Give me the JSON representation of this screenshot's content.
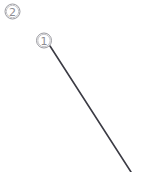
{
  "figure": {
    "width": 166,
    "height": 172,
    "background_color": "#ffffff",
    "callouts": [
      {
        "id": "callout-2",
        "label": "2",
        "display_glyph": "②",
        "center_x": 12.5,
        "center_y": 11.5,
        "radius": 7.5,
        "ring_color": "#9a9aa0",
        "text_color": "#8d8d92"
      },
      {
        "id": "callout-1",
        "label": "1",
        "display_glyph": "①",
        "center_x": 44,
        "center_y": 40.5,
        "radius": 7.5,
        "ring_color": "#9a9aa0",
        "text_color": "#8d8d92"
      }
    ],
    "leader_lines": [
      {
        "id": "leader-line-1",
        "from_callout": "1",
        "x1": 50,
        "y1": 46,
        "x2": 131,
        "y2": 172,
        "color": "#3b3b44",
        "width": 1.6
      }
    ]
  }
}
